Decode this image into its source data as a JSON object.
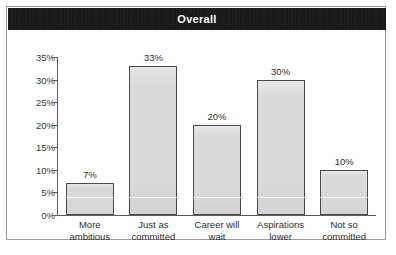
{
  "title": "Overall",
  "colors": {
    "banner_background": "#121212",
    "banner_text": "#ffffff",
    "bar_fill": "#d9d9d9",
    "bar_border": "#4a4a4a",
    "axis": "#5c5c5c",
    "frame_border": "#9a9a9a",
    "page_background": "#ffffff"
  },
  "chart_data": {
    "type": "bar",
    "title": "Overall",
    "subtitle": "",
    "xlabel": "",
    "ylabel": "",
    "categories": [
      "More ambitious",
      "Just as committed",
      "Career will wait",
      "Aspirations lower",
      "Not so committed"
    ],
    "category_lines": [
      [
        "More",
        "ambitious"
      ],
      [
        "Just as",
        "committed"
      ],
      [
        "Career will",
        "wait"
      ],
      [
        "Aspirations",
        "lower"
      ],
      [
        "Not so",
        "committed"
      ]
    ],
    "values": [
      7,
      33,
      20,
      30,
      10
    ],
    "data_labels": [
      "7%",
      "33%",
      "20%",
      "30%",
      "10%"
    ],
    "ylim": [
      0,
      35
    ],
    "ytick_values": [
      0,
      5,
      10,
      15,
      20,
      25,
      30,
      35
    ],
    "ytick_labels": [
      "0%",
      "5%",
      "10%",
      "15%",
      "20%",
      "25%",
      "30%",
      "35%"
    ],
    "grid": false,
    "legend": false,
    "legend_position": "none"
  }
}
